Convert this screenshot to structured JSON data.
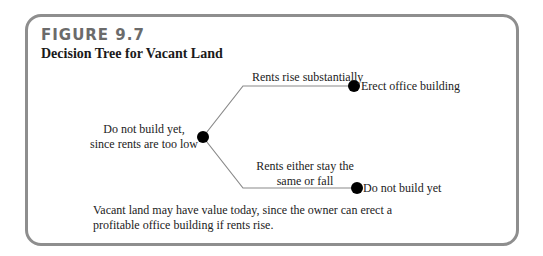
{
  "figure": {
    "label": "FIGURE 9.7",
    "title": "Decision Tree for Vacant Land",
    "caption": "Vacant land may have value today, since the owner can erect a profitable office building if rents rise."
  },
  "tree": {
    "root": {
      "label": "Do not build yet, since rents are too low"
    },
    "branches": [
      {
        "label": "Rents rise substantially",
        "outcome": "Erect office building"
      },
      {
        "label": "Rents either stay the same or fall",
        "outcome": "Do not build yet"
      }
    ]
  },
  "colors": {
    "frame": "#8e8e8e",
    "figure_label": "#6b6b6b",
    "line": "#8a8a8a",
    "node": "#000000",
    "text": "#222222"
  }
}
